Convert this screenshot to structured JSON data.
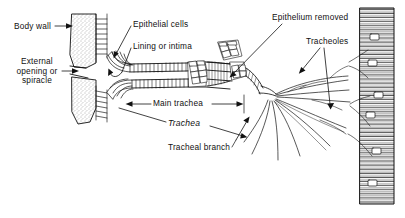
{
  "figure": {
    "background_color": "#ffffff",
    "ink_color": "#111111",
    "width": 405,
    "height": 218
  },
  "labels": {
    "body_wall": "Body wall",
    "external_opening": "External opening or spiracle",
    "epithelial_cells": "Epithelial cells",
    "lining_or_intima": "Lining or intima",
    "epithelium_removed": "Epithelium removed",
    "tracheoles": "Tracheoles",
    "main_trachea": "Main trachea",
    "trachea": "Trachea",
    "tracheal_branch": "Tracheal branch"
  },
  "structures": {
    "body_wall": "stippled cuticle wall at left with ladder-rung inner lining",
    "spiracle": "external opening in body wall leading into atrium",
    "trachea": "horizontal tube with taenidial ring rungs and cobblestone epithelial cells",
    "epithelium_removed_region": "section of trachea drawn without surrounding epithelial cells",
    "tracheal_branch": "tapering tube splitting from main trachea",
    "tracheoles": "fine terminal branches fanning out to muscle",
    "muscle_fiber": "horizontally hatched vertical column at right with oval nuclei"
  }
}
